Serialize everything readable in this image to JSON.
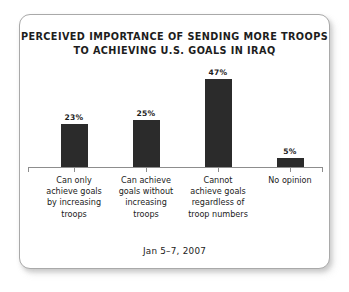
{
  "card": {
    "border_color": "#a9a9a9",
    "background": "#ffffff"
  },
  "title": {
    "line1": "PERCEIVED IMPORTANCE OF SENDING MORE TROOPS",
    "line2": "TO ACHIEVING U.S. GOALS IN IRAQ"
  },
  "footer": {
    "date": "Jan 5–7, 2007"
  },
  "chart_data": {
    "type": "bar",
    "title": "PERCEIVED IMPORTANCE OF SENDING MORE TROOPS TO ACHIEVING U.S. GOALS IN IRAQ",
    "subtitle": "Jan 5–7, 2007",
    "xlabel": "",
    "ylabel": "",
    "ylim": [
      0,
      50
    ],
    "grid": false,
    "legend": "none",
    "bar_color": "#2b2b2b",
    "axis_color": "#8d8d8d",
    "categories": [
      "Can only achieve goals by increasing troops",
      "Can achieve goals without increasing troops",
      "Cannot achieve goals regardless of troop numbers",
      "No opinion"
    ],
    "category_lines": [
      [
        "Can only",
        "achieve goals",
        "by increasing",
        "troops"
      ],
      [
        "Can achieve",
        "goals without",
        "increasing",
        "troops"
      ],
      [
        "Cannot",
        "achieve goals",
        "regardless of",
        "troop numbers"
      ],
      [
        "No opinion"
      ]
    ],
    "values": [
      23,
      25,
      47,
      5
    ],
    "value_labels": [
      "23%",
      "25%",
      "47%",
      "5%"
    ]
  }
}
